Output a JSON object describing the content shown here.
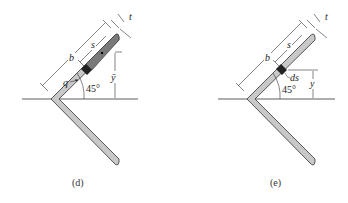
{
  "figure": {
    "panels": [
      {
        "id": "d",
        "caption": "(d)",
        "labels": {
          "thickness": "t",
          "arc_length": "s",
          "leg_length": "b",
          "flow": "q",
          "centroid_height": "ȳ",
          "angle": "45°"
        }
      },
      {
        "id": "e",
        "caption": "(e)",
        "labels": {
          "thickness": "t",
          "arc_length": "s",
          "leg_length": "b",
          "element": "ds",
          "height": "y",
          "angle": "45°"
        }
      }
    ],
    "colors": {
      "section_fill": "#c8c8c8",
      "shaded_fill": "#7a7a7a",
      "element_fill": "#222222",
      "line": "#333333"
    }
  }
}
